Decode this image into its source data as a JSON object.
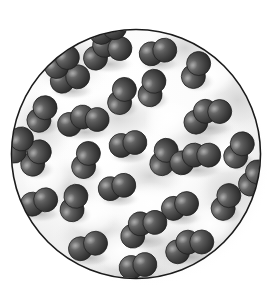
{
  "figure": {
    "caption": "",
    "kind": "molecular-view-diagram",
    "container": {
      "shape": "circle",
      "center_x": 136,
      "center_y": 154,
      "radius": 125,
      "outline_color": "#1a1a1a",
      "outline_width": 1.6,
      "fill_color": "#fdfdfd",
      "shadow_color": "#c9c9c9",
      "has_drop_shadow": true,
      "mottled_shading": true
    },
    "molecule_style": {
      "atoms_per_molecule": 2,
      "atom_radius": 12,
      "bond_separation": 14,
      "atom_color_dark": "#3b3b3b",
      "atom_color_mid": "#555555",
      "atom_color_light": "#7a7a7a",
      "atom_highlight": "#9a9a9a",
      "atom_edge_color": "#1f1f1f",
      "shadow_color": "#b5b5b5",
      "render": "airbrush-shaded-sphere"
    },
    "molecule_count": 28,
    "molecules": [
      {
        "id": "m01",
        "x": 107,
        "y": 52,
        "angle": -28,
        "atoms": 3
      },
      {
        "id": "m02",
        "x": 158,
        "y": 52,
        "angle": -15,
        "atoms": 2
      },
      {
        "id": "m03",
        "x": 196,
        "y": 70,
        "angle": -68,
        "atoms": 2
      },
      {
        "id": "m04",
        "x": 70,
        "y": 79,
        "angle": -16,
        "atoms": 2
      },
      {
        "id": "m05",
        "x": 122,
        "y": 96,
        "angle": -70,
        "atoms": 2
      },
      {
        "id": "m06",
        "x": 152,
        "y": 88,
        "angle": -74,
        "atoms": 2
      },
      {
        "id": "m07",
        "x": 42,
        "y": 114,
        "angle": -64,
        "atoms": 2
      },
      {
        "id": "m08",
        "x": 83,
        "y": 120,
        "angle": -10,
        "atoms": 3
      },
      {
        "id": "m09",
        "x": 207,
        "y": 115,
        "angle": -24,
        "atoms": 3
      },
      {
        "id": "m10",
        "x": 128,
        "y": 144,
        "angle": -12,
        "atoms": 2
      },
      {
        "id": "m11",
        "x": 164,
        "y": 157,
        "angle": -72,
        "atoms": 2
      },
      {
        "id": "m12",
        "x": 36,
        "y": 158,
        "angle": -62,
        "atoms": 2
      },
      {
        "id": "m13",
        "x": 86,
        "y": 160,
        "angle": -70,
        "atoms": 2
      },
      {
        "id": "m14",
        "x": 195,
        "y": 158,
        "angle": -16,
        "atoms": 3
      },
      {
        "id": "m15",
        "x": 239,
        "y": 150,
        "angle": -62,
        "atoms": 2
      },
      {
        "id": "m16",
        "x": 117,
        "y": 187,
        "angle": -14,
        "atoms": 2
      },
      {
        "id": "m17",
        "x": 39,
        "y": 202,
        "angle": -18,
        "atoms": 2
      },
      {
        "id": "m18",
        "x": 74,
        "y": 203,
        "angle": -74,
        "atoms": 2
      },
      {
        "id": "m19",
        "x": 180,
        "y": 206,
        "angle": -20,
        "atoms": 2
      },
      {
        "id": "m20",
        "x": 226,
        "y": 202,
        "angle": -66,
        "atoms": 2
      },
      {
        "id": "m21",
        "x": 143,
        "y": 228,
        "angle": -34,
        "atoms": 3
      },
      {
        "id": "m22",
        "x": 88,
        "y": 246,
        "angle": -20,
        "atoms": 2
      },
      {
        "id": "m23",
        "x": 189,
        "y": 245,
        "angle": -22,
        "atoms": 3
      },
      {
        "id": "m24",
        "x": 138,
        "y": 266,
        "angle": -12,
        "atoms": 2
      },
      {
        "id": "m25",
        "x": 62,
        "y": 62,
        "angle": -40,
        "atoms": 1
      },
      {
        "id": "m26",
        "x": 20,
        "y": 145,
        "angle": -60,
        "atoms": 1
      },
      {
        "id": "m27",
        "x": 253,
        "y": 178,
        "angle": -60,
        "atoms": 1
      },
      {
        "id": "m28",
        "x": 108,
        "y": 28,
        "angle": -20,
        "atoms": 1
      }
    ]
  }
}
